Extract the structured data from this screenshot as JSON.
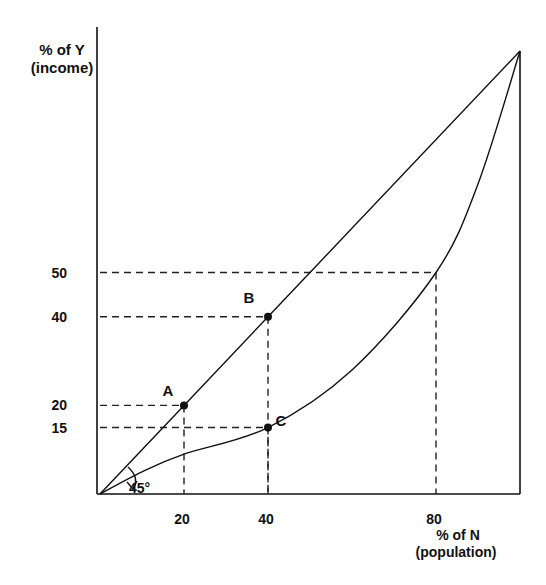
{
  "chart_data": {
    "type": "line",
    "title": "",
    "ylabel": [
      "% of Y",
      "(income)"
    ],
    "xlabel": [
      "% of N",
      "(population)"
    ],
    "xlim": [
      0,
      100
    ],
    "ylim": [
      0,
      100
    ],
    "grid": false,
    "x_ticks": [
      20,
      40,
      80
    ],
    "y_ticks": [
      15,
      20,
      40,
      50
    ],
    "series": [
      {
        "name": "equality line",
        "points": [
          [
            0,
            0
          ],
          [
            20,
            20
          ],
          [
            40,
            40
          ],
          [
            100,
            100
          ]
        ]
      },
      {
        "name": "lorenz curve",
        "points": [
          [
            0,
            0
          ],
          [
            10,
            5
          ],
          [
            20,
            9
          ],
          [
            40,
            15
          ],
          [
            60,
            28
          ],
          [
            80,
            50
          ],
          [
            90,
            70
          ],
          [
            100,
            100
          ]
        ]
      }
    ],
    "points": [
      {
        "label": "A",
        "x": 20,
        "y": 20
      },
      {
        "label": "B",
        "x": 40,
        "y": 40
      },
      {
        "label": "C",
        "x": 40,
        "y": 15
      }
    ],
    "guides": [
      {
        "x": 20,
        "y": 20
      },
      {
        "x": 40,
        "y": 40
      },
      {
        "x": 40,
        "y": 15
      },
      {
        "x": 80,
        "y": 50
      }
    ],
    "annotations": [
      {
        "text": "45°"
      }
    ]
  }
}
